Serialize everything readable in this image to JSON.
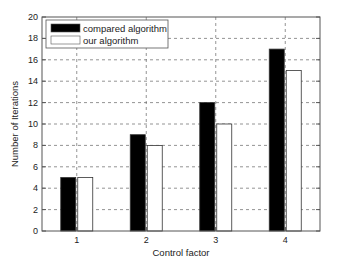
{
  "chart_data": {
    "type": "bar",
    "title": "",
    "xlabel": "Control factor",
    "ylabel": "Number of Iterations",
    "categories": [
      "1",
      "2",
      "3",
      "4"
    ],
    "series": [
      {
        "name": "compared algorithm",
        "color": "#000000",
        "values": [
          5,
          9,
          12,
          17
        ]
      },
      {
        "name": "our algorithm",
        "color": "#ffffff",
        "values": [
          5,
          8,
          10,
          15
        ]
      }
    ],
    "ylim": [
      0,
      20
    ],
    "yticks": [
      "0",
      "2",
      "4",
      "6",
      "8",
      "10",
      "12",
      "14",
      "16",
      "18",
      "20"
    ],
    "grid": true,
    "legend_position": "top-left"
  }
}
